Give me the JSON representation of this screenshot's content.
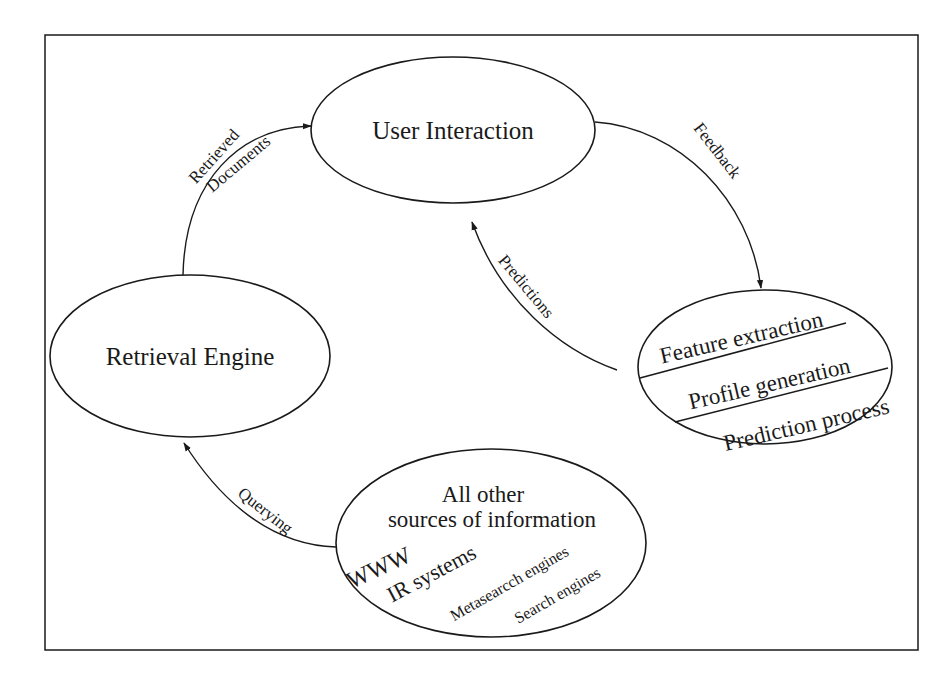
{
  "diagram": {
    "nodes": {
      "user_interaction": {
        "label": "User Interaction"
      },
      "retrieval_engine": {
        "label": "Retrieval Engine"
      },
      "profiler": {
        "sections": [
          "Feature extraction",
          "Profile generation",
          "Prediction process"
        ]
      },
      "sources": {
        "title_line1": "All other",
        "title_line2": "sources of information",
        "items": [
          "WWW",
          "IR systems",
          "Metasearcch engines",
          "Search engines"
        ]
      }
    },
    "edges": {
      "retrieved_documents": {
        "line1": "Retrieved",
        "line2": "Documents"
      },
      "feedback": {
        "label": "Feedback"
      },
      "predictions": {
        "label": "Predictions"
      },
      "querying": {
        "label": "Querying"
      }
    }
  }
}
